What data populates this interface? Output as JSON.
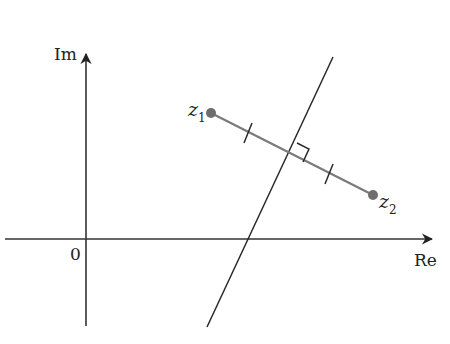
{
  "diagram": {
    "type": "complex-plane-perpendicular-bisector",
    "axes": {
      "real_label": "Re",
      "imag_label": "Im",
      "origin_label": "0",
      "origin": [
        86,
        239
      ],
      "real_axis": {
        "x1": 5,
        "x2": 432,
        "y": 239
      },
      "imag_axis": {
        "x": 86,
        "y1": 52,
        "y2": 326
      }
    },
    "points": [
      {
        "id": "z1",
        "letter": "z",
        "subscript": "1",
        "pos": [
          211,
          113
        ]
      },
      {
        "id": "z2",
        "letter": "z",
        "subscript": "2",
        "pos": [
          373,
          195
        ]
      }
    ],
    "segment": {
      "from": "z1",
      "to": "z2",
      "color": "#7a7a7a"
    },
    "bisector": {
      "x1": 333,
      "y1": 57,
      "x2": 207,
      "y2": 327,
      "color": "#2a2a2a"
    },
    "midpoint": [
      292,
      154
    ],
    "tick_marks": 2,
    "right_angle_marker": true,
    "colors": {
      "axis": "#333333",
      "point": "#6e6e6e",
      "text": "#222222"
    }
  }
}
